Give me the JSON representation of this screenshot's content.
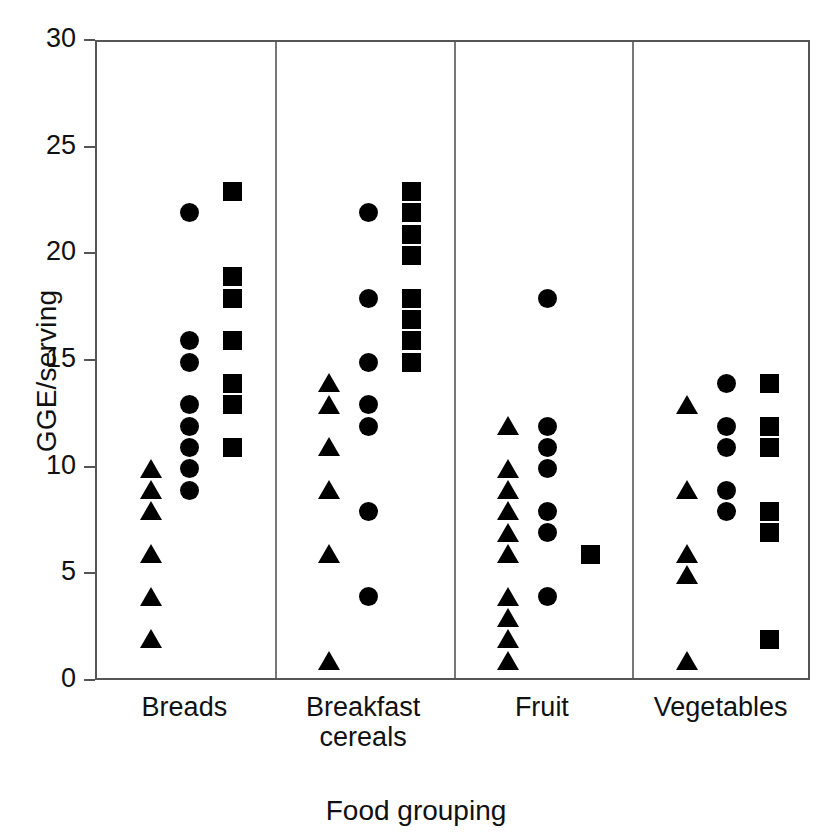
{
  "chart_data": {
    "type": "scatter",
    "title": "",
    "xlabel": "Food grouping",
    "ylabel": "GGE/serving",
    "ylim": [
      0,
      30
    ],
    "yticks": [
      0,
      5,
      10,
      15,
      20,
      25,
      30
    ],
    "ytick_labels": [
      "0",
      "5",
      "10",
      "15",
      "20",
      "25",
      "30"
    ],
    "grid": false,
    "legend": "none",
    "categories": [
      "Breads",
      "Breakfast cereals",
      "Fruit",
      "Vegetables"
    ],
    "category_label_lines": [
      [
        "Breads"
      ],
      [
        "Breakfast",
        "cereals"
      ],
      [
        "Fruit"
      ],
      [
        "Vegetables"
      ]
    ],
    "marker_shapes": [
      "triangle",
      "circle",
      "square"
    ],
    "groups": [
      {
        "name": "Breads",
        "series": [
          {
            "shape": "triangle",
            "values": [
              10,
              9,
              8,
              6,
              4,
              2
            ]
          },
          {
            "shape": "circle",
            "values": [
              22,
              16,
              15,
              13,
              12,
              11,
              10,
              9
            ]
          },
          {
            "shape": "square",
            "values": [
              23,
              19,
              18,
              16,
              14,
              13,
              11
            ]
          }
        ]
      },
      {
        "name": "Breakfast cereals",
        "series": [
          {
            "shape": "triangle",
            "values": [
              14,
              13,
              11,
              9,
              6,
              1
            ]
          },
          {
            "shape": "circle",
            "values": [
              22,
              18,
              15,
              13,
              12,
              8,
              4
            ]
          },
          {
            "shape": "square",
            "values": [
              23,
              22,
              21,
              20,
              18,
              17,
              16,
              15
            ]
          }
        ]
      },
      {
        "name": "Fruit",
        "series": [
          {
            "shape": "triangle",
            "values": [
              12,
              10,
              9,
              8,
              7,
              6,
              4,
              3,
              2,
              1
            ]
          },
          {
            "shape": "circle",
            "values": [
              18,
              12,
              11,
              10,
              8,
              7,
              4
            ]
          },
          {
            "shape": "square",
            "values": [
              6
            ]
          }
        ]
      },
      {
        "name": "Vegetables",
        "series": [
          {
            "shape": "triangle",
            "values": [
              13,
              9,
              6,
              5,
              1
            ]
          },
          {
            "shape": "circle",
            "values": [
              14,
              12,
              11,
              9,
              8
            ]
          },
          {
            "shape": "square",
            "values": [
              14,
              12,
              11,
              8,
              7,
              2
            ]
          }
        ]
      }
    ],
    "colors": {
      "marker": "#000000",
      "axis": "#555555",
      "divider": "#777777",
      "background": "#ffffff",
      "text": "#111111"
    }
  }
}
